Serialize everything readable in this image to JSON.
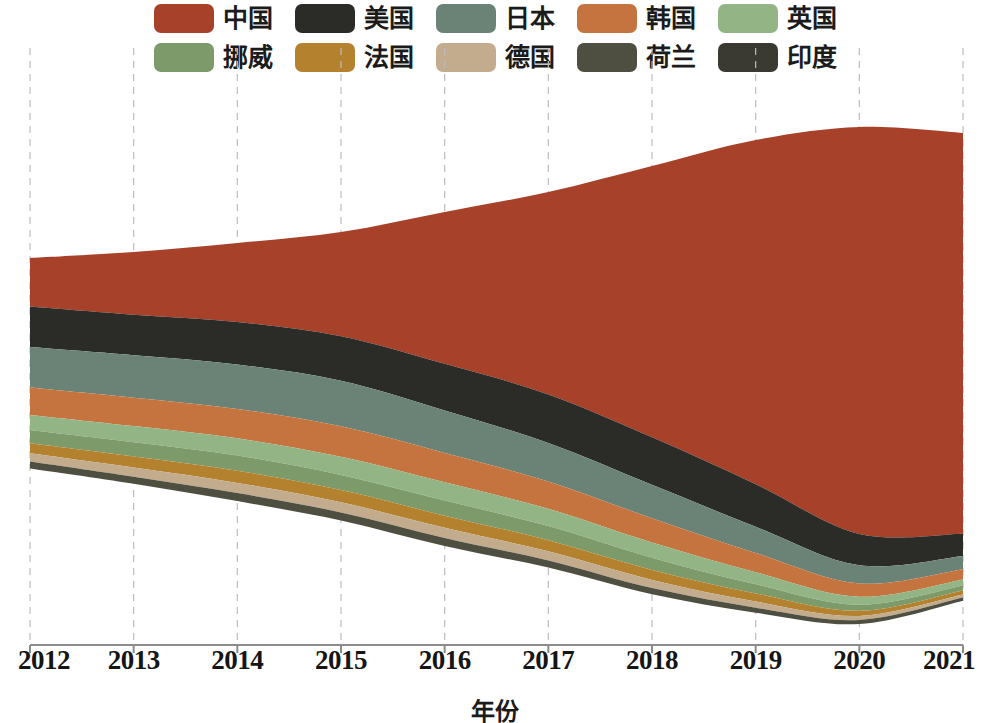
{
  "chart_data": {
    "type": "area",
    "variant": "streamgraph",
    "title": "",
    "subtitle": "",
    "xlabel": "年份",
    "ylabel": "",
    "grid": true,
    "grid_axis": "x",
    "legend_position": "top",
    "x": [
      2012,
      2013,
      2014,
      2015,
      2016,
      2017,
      2018,
      2019,
      2020,
      2021
    ],
    "categories": [
      "2012",
      "2013",
      "2014",
      "2015",
      "2016",
      "2017",
      "2018",
      "2019",
      "2020",
      "2021"
    ],
    "xlim": [
      2012,
      2021
    ],
    "stack_order": [
      "中国",
      "美国",
      "日本",
      "韩国",
      "英国",
      "挪威",
      "法国",
      "德国",
      "荷兰",
      "印度"
    ],
    "series": [
      {
        "name": "中国",
        "color": "#a8412a",
        "values": [
          48,
          62,
          78,
          103,
          150,
          200,
          268,
          340,
          402,
          396
        ]
      },
      {
        "name": "美国",
        "color": "#2b2b28",
        "values": [
          40,
          40,
          42,
          44,
          46,
          48,
          47,
          42,
          31,
          22
        ]
      },
      {
        "name": "日本",
        "color": "#6b8377",
        "values": [
          40,
          42,
          44,
          45,
          42,
          38,
          33,
          26,
          18,
          13
        ]
      },
      {
        "name": "韩国",
        "color": "#c6743f",
        "values": [
          27,
          28,
          29,
          30,
          29,
          27,
          24,
          19,
          13,
          10
        ]
      },
      {
        "name": "英国",
        "color": "#93b485",
        "values": [
          15,
          16,
          17,
          18,
          18,
          17,
          15,
          12,
          8,
          6
        ]
      },
      {
        "name": "挪威",
        "color": "#7d9b6a",
        "values": [
          13,
          14,
          15,
          15,
          15,
          14,
          12,
          9,
          6,
          5
        ]
      },
      {
        "name": "法国",
        "color": "#b4822f",
        "values": [
          10,
          11,
          12,
          12,
          12,
          11,
          10,
          8,
          5,
          4
        ]
      },
      {
        "name": "德国",
        "color": "#c3ab8e",
        "values": [
          8,
          9,
          10,
          10,
          10,
          9,
          8,
          6,
          4,
          3
        ]
      },
      {
        "name": "荷兰",
        "color": "#4e4f40",
        "values": [
          7,
          7,
          8,
          8,
          8,
          7,
          6,
          5,
          4,
          3
        ]
      },
      {
        "name": "印度",
        "color": "#3a3a33",
        "values": [
          0,
          0,
          0,
          0,
          0,
          0,
          0,
          0,
          0,
          0
        ]
      }
    ]
  },
  "legend": {
    "rows": [
      [
        {
          "label": "中国",
          "color": "#a8412a"
        },
        {
          "label": "美国",
          "color": "#2b2b28"
        },
        {
          "label": "日本",
          "color": "#6b8377"
        },
        {
          "label": "韩国",
          "color": "#c6743f"
        },
        {
          "label": "英国",
          "color": "#93b485"
        }
      ],
      [
        {
          "label": "挪威",
          "color": "#7d9b6a"
        },
        {
          "label": "法国",
          "color": "#b4822f"
        },
        {
          "label": "德国",
          "color": "#c3ab8e"
        },
        {
          "label": "荷兰",
          "color": "#4e4f40"
        },
        {
          "label": "印度",
          "color": "#3a3a33"
        }
      ]
    ]
  },
  "axis": {
    "x_title": "年份",
    "x_ticks": [
      "2012",
      "2013",
      "2014",
      "2015",
      "2016",
      "2017",
      "2018",
      "2019",
      "2020",
      "2021"
    ]
  }
}
